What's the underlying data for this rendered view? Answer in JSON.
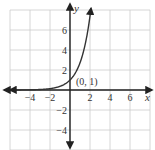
{
  "chart_data": {
    "type": "line",
    "title": "",
    "function": "y = e^x",
    "xlabel": "x",
    "ylabel": "y",
    "xlim": [
      -6,
      8
    ],
    "ylim": [
      -6,
      8
    ],
    "grid": true,
    "grid_step": 2,
    "x_ticks": [
      -4,
      -2,
      2,
      4,
      6
    ],
    "y_ticks": [
      6,
      4,
      2,
      -2,
      -4
    ],
    "x_tick_labels": [
      "−4",
      "−2",
      "2",
      "4",
      "6"
    ],
    "y_tick_labels": [
      "6",
      "4",
      "2",
      "−2",
      "−4"
    ],
    "series": [
      {
        "name": "exponential curve",
        "x": [
          -6,
          -4,
          -2,
          -1,
          0,
          0.5,
          1,
          1.5,
          2,
          2.1
        ],
        "y": [
          0.0025,
          0.018,
          0.135,
          0.368,
          1,
          1.65,
          2.72,
          4.48,
          7.39,
          8.17
        ]
      }
    ],
    "annotations": [
      {
        "text": "(0, 1)",
        "x": 0,
        "y": 1
      }
    ],
    "colors": {
      "curve": "#333333",
      "axes": "#222222",
      "grid": "#cccccc"
    }
  }
}
